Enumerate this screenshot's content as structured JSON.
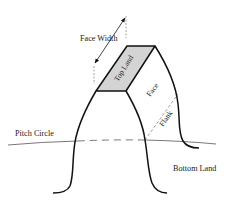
{
  "diagram": {
    "type": "gear-tooth-nomenclature",
    "labels": {
      "face_width": "Face Width",
      "top_land": "Top Land",
      "face": "Face",
      "flank": "Flank",
      "pitch_circle": "Pitch Circle",
      "bottom_land": "Bottom Land"
    },
    "colors": {
      "line": "#111111",
      "top_land_fill": "#d4d4d4",
      "thin_line": "#555555",
      "background": "#ffffff"
    }
  }
}
